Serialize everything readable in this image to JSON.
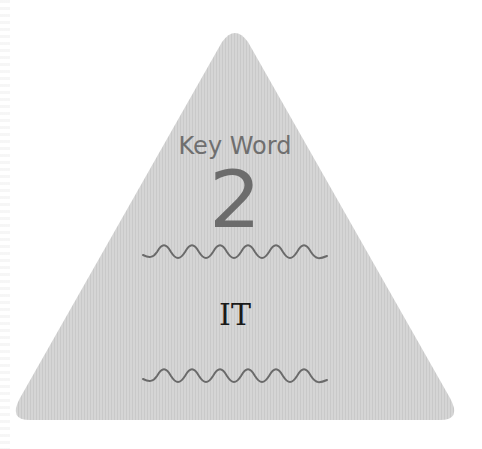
{
  "card": {
    "heading": "Key Word",
    "number": "2",
    "term": "IT",
    "colors": {
      "fill": "#d3d3d3",
      "stripe": "#c8c8c8",
      "heading": "#6f6f6f",
      "number": "#6c6c6c",
      "term": "#1a1a1a",
      "wave": "#6a6a6a"
    },
    "decorations": {
      "top_wave": "wavy-line",
      "bottom_wave": "wavy-line",
      "wave_peaks": 7
    }
  }
}
